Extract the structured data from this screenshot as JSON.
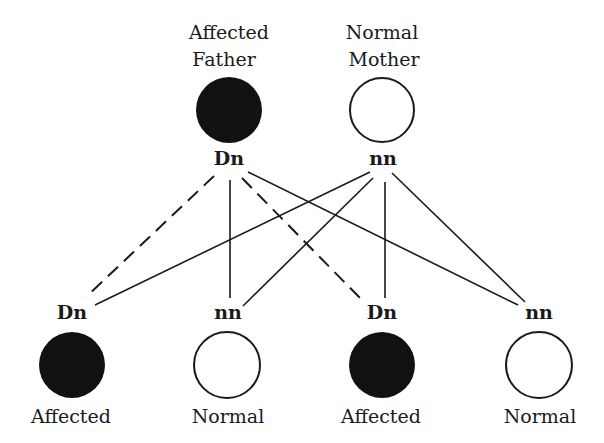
{
  "colors": {
    "affected_fill": "#111111",
    "normal_fill": "#ffffff",
    "line": "#1a1a1a"
  },
  "parents": [
    {
      "caption_line1": "Affected",
      "caption_line2": "Father",
      "genotype": "Dn",
      "status": "affected"
    },
    {
      "caption_line1": "Normal",
      "caption_line2": "Mother",
      "genotype": "nn",
      "status": "normal"
    }
  ],
  "offspring": [
    {
      "genotype": "Dn",
      "caption": "Affected",
      "status": "affected"
    },
    {
      "genotype": "nn",
      "caption": "Normal",
      "status": "normal"
    },
    {
      "genotype": "Dn",
      "caption": "Affected",
      "status": "affected"
    },
    {
      "genotype": "nn",
      "caption": "Normal",
      "status": "normal"
    }
  ],
  "legend": {
    "dashed_line": "transmission of D allele",
    "solid_line": "transmission of n allele"
  }
}
